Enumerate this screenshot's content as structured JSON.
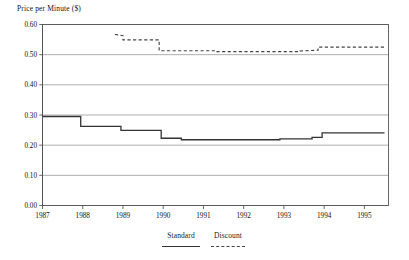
{
  "chart_data": {
    "type": "line",
    "title": "Price per Minute ($)",
    "xlabel": "",
    "ylabel": "Price per Minute ($)",
    "ylim": [
      0.0,
      0.6
    ],
    "xlim": [
      1987,
      1995.6
    ],
    "grid": true,
    "legend_position": "bottom-center",
    "ytick_labels": [
      "0.60",
      "0.50",
      "0.40",
      "0.30",
      "0.20",
      "0.10",
      "0.00"
    ],
    "ytick_values": [
      0.6,
      0.5,
      0.4,
      0.3,
      0.2,
      0.1,
      0.0
    ],
    "xtick_labels": [
      "1987",
      "1988",
      "1989",
      "1990",
      "1991",
      "1992",
      "1993",
      "1994",
      "1995"
    ],
    "xtick_values": [
      1987,
      1988,
      1989,
      1990,
      1991,
      1992,
      1993,
      1994,
      1995
    ],
    "series": [
      {
        "name": "Standard",
        "style": "solid",
        "color": "#333333",
        "points": [
          [
            1987.0,
            0.295
          ],
          [
            1987.95,
            0.295
          ],
          [
            1987.95,
            0.262
          ],
          [
            1988.95,
            0.262
          ],
          [
            1988.95,
            0.249
          ],
          [
            1989.95,
            0.249
          ],
          [
            1989.95,
            0.223
          ],
          [
            1990.45,
            0.223
          ],
          [
            1990.45,
            0.218
          ],
          [
            1992.9,
            0.218
          ],
          [
            1992.9,
            0.221
          ],
          [
            1993.7,
            0.221
          ],
          [
            1993.7,
            0.226
          ],
          [
            1993.95,
            0.226
          ],
          [
            1993.95,
            0.241
          ],
          [
            1995.5,
            0.241
          ]
        ]
      },
      {
        "name": "Discount",
        "style": "dashed",
        "color": "#444444",
        "points": [
          [
            1988.8,
            0.567
          ],
          [
            1989.0,
            0.563
          ],
          [
            1989.0,
            0.549
          ],
          [
            1989.9,
            0.549
          ],
          [
            1989.9,
            0.513
          ],
          [
            1991.3,
            0.513
          ],
          [
            1991.3,
            0.51
          ],
          [
            1993.4,
            0.51
          ],
          [
            1993.4,
            0.512
          ],
          [
            1993.85,
            0.515
          ],
          [
            1993.85,
            0.525
          ],
          [
            1995.5,
            0.525
          ]
        ]
      }
    ]
  },
  "legend": {
    "items": [
      {
        "label": "Standard",
        "style": "solid"
      },
      {
        "label": "Discount",
        "style": "dashed"
      }
    ]
  }
}
